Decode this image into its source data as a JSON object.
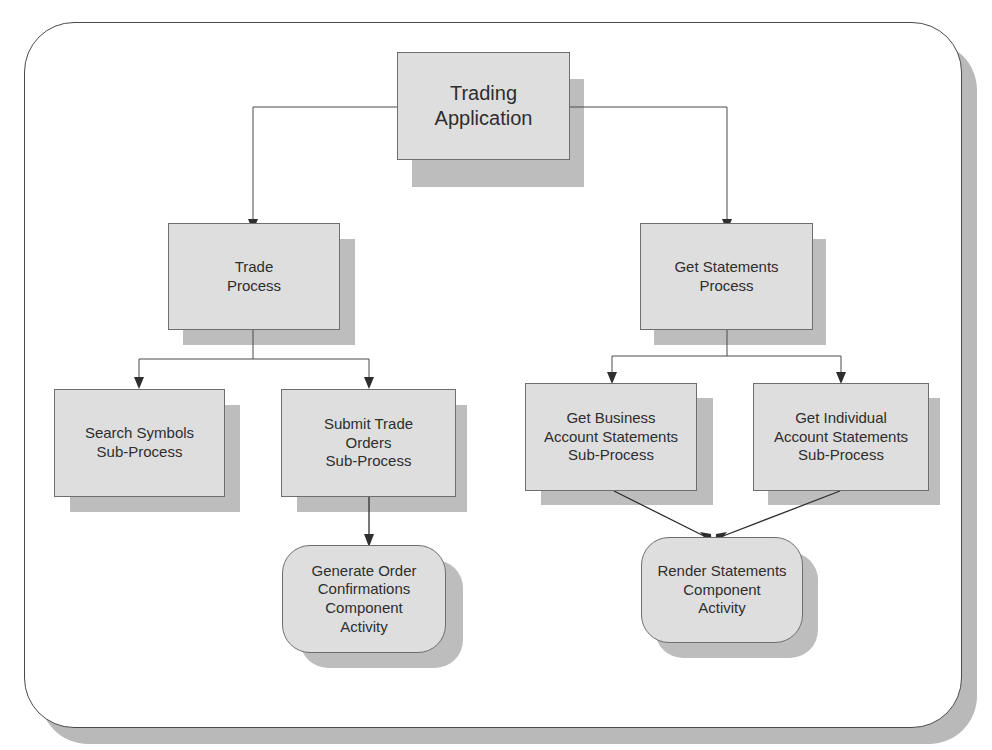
{
  "diagram": {
    "type": "hierarchy",
    "colors": {
      "node_fill": "#dedede",
      "node_border": "#6e6e6e",
      "shadow": "#bdbdbd",
      "line": "#4a4a4a",
      "text": "#2e2e2e"
    },
    "nodes": {
      "root": {
        "label": "Trading\nApplication",
        "kind": "application"
      },
      "trade": {
        "label": "Trade\nProcess",
        "kind": "process"
      },
      "statements": {
        "label": "Get Statements\nProcess",
        "kind": "process"
      },
      "search": {
        "label": "Search Symbols\nSub-Process",
        "kind": "sub-process"
      },
      "submit": {
        "label": "Submit Trade\nOrders\nSub-Process",
        "kind": "sub-process"
      },
      "business": {
        "label": "Get Business\nAccount Statements\nSub-Process",
        "kind": "sub-process"
      },
      "individual": {
        "label": "Get Individual\nAccount Statements\nSub-Process",
        "kind": "sub-process"
      },
      "confirm": {
        "label": "Generate Order\nConfirmations\nComponent\nActivity",
        "kind": "component-activity"
      },
      "render": {
        "label": "Render Statements\nComponent\nActivity",
        "kind": "component-activity"
      }
    },
    "edges": [
      {
        "from": "root",
        "to": "trade"
      },
      {
        "from": "root",
        "to": "statements"
      },
      {
        "from": "trade",
        "to": "search"
      },
      {
        "from": "trade",
        "to": "submit"
      },
      {
        "from": "statements",
        "to": "business"
      },
      {
        "from": "statements",
        "to": "individual"
      },
      {
        "from": "submit",
        "to": "confirm"
      },
      {
        "from": "business",
        "to": "render"
      },
      {
        "from": "individual",
        "to": "render"
      }
    ]
  }
}
